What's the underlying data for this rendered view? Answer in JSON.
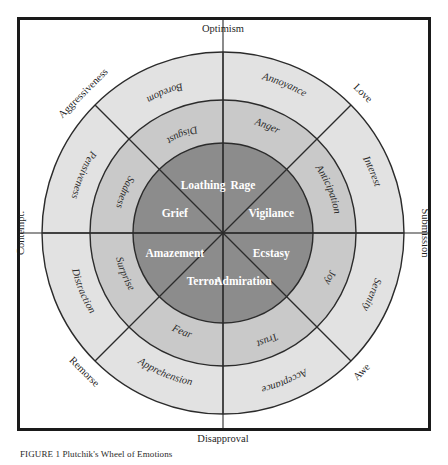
{
  "figure": {
    "type": "plutchik-wheel-of-emotions",
    "center": {
      "x": 223,
      "y": 233
    },
    "radii": {
      "inner": 90,
      "middle": 133,
      "outer": 181
    },
    "colors": {
      "ring_inner": "#8c8c8c",
      "ring_middle": "#c9c9c9",
      "ring_outer": "#e2e2e2",
      "stroke": "#2b2b2b",
      "frame": "#1a1a1a",
      "inner_text": "#ffffff",
      "outer_text": "#2b2b2b",
      "background": "#ffffff"
    },
    "sector_count": 8
  },
  "caption": {
    "text": "FIGURE 1 Plutchik's Wheel of Emotions"
  },
  "rings": {
    "inner": {
      "name": "intense emotions",
      "labels": [
        {
          "id": "ecstasy",
          "text": "Ecstasy",
          "angle_deg": 22.5
        },
        {
          "id": "admiration",
          "text": "Admiration",
          "angle_deg": 67.5
        },
        {
          "id": "terror",
          "text": "Terror",
          "angle_deg": 112.5
        },
        {
          "id": "amazement",
          "text": "Amazement",
          "angle_deg": 157.5
        },
        {
          "id": "grief",
          "text": "Grief",
          "angle_deg": 202.5
        },
        {
          "id": "loathing",
          "text": "Loathing",
          "angle_deg": 247.5
        },
        {
          "id": "rage",
          "text": "Rage",
          "angle_deg": 292.5
        },
        {
          "id": "vigilance",
          "text": "Vigilance",
          "angle_deg": 337.5
        }
      ]
    },
    "middle": {
      "name": "basic emotions",
      "labels": [
        {
          "id": "joy",
          "text": "Joy",
          "angle_deg": 22.5
        },
        {
          "id": "trust",
          "text": "Trust",
          "angle_deg": 67.5
        },
        {
          "id": "fear",
          "text": "Fear",
          "angle_deg": 112.5
        },
        {
          "id": "surprise",
          "text": "Surprise",
          "angle_deg": 157.5
        },
        {
          "id": "sadness",
          "text": "Sadness",
          "angle_deg": 202.5
        },
        {
          "id": "disgust",
          "text": "Disgust",
          "angle_deg": 247.5
        },
        {
          "id": "anger",
          "text": "Anger",
          "angle_deg": 292.5
        },
        {
          "id": "anticipation",
          "text": "Anticipation",
          "angle_deg": 337.5
        }
      ]
    },
    "outer": {
      "name": "mild emotions",
      "labels": [
        {
          "id": "serenity",
          "text": "Serenity",
          "angle_deg": 22.5
        },
        {
          "id": "acceptance",
          "text": "Acceptance",
          "angle_deg": 67.5
        },
        {
          "id": "apprehension",
          "text": "Apprehension",
          "angle_deg": 112.5
        },
        {
          "id": "distraction",
          "text": "Distraction",
          "angle_deg": 157.5
        },
        {
          "id": "pensiveness",
          "text": "Pensiveness",
          "angle_deg": 202.5
        },
        {
          "id": "boredom",
          "text": "Boredom",
          "angle_deg": 247.5
        },
        {
          "id": "annoyance",
          "text": "Annoyance",
          "angle_deg": 292.5
        },
        {
          "id": "interest",
          "text": "Interest",
          "angle_deg": 337.5
        }
      ]
    }
  },
  "dyads": [
    {
      "id": "optimism",
      "text": "Optimism",
      "angle_deg": 270,
      "orientation": "horizontal"
    },
    {
      "id": "love",
      "text": "Love",
      "angle_deg": 315,
      "orientation": "diagonal"
    },
    {
      "id": "submission",
      "text": "Submission",
      "angle_deg": 0,
      "orientation": "vertical"
    },
    {
      "id": "awe",
      "text": "Awe",
      "angle_deg": 45,
      "orientation": "diagonal"
    },
    {
      "id": "disapproval",
      "text": "Disapproval",
      "angle_deg": 90,
      "orientation": "horizontal"
    },
    {
      "id": "remorse",
      "text": "Remorse",
      "angle_deg": 135,
      "orientation": "diagonal"
    },
    {
      "id": "contempt",
      "text": "Contempt.",
      "angle_deg": 180,
      "orientation": "vertical"
    },
    {
      "id": "aggressiveness",
      "text": "Aggressiveness",
      "angle_deg": 225,
      "orientation": "diagonal"
    }
  ]
}
